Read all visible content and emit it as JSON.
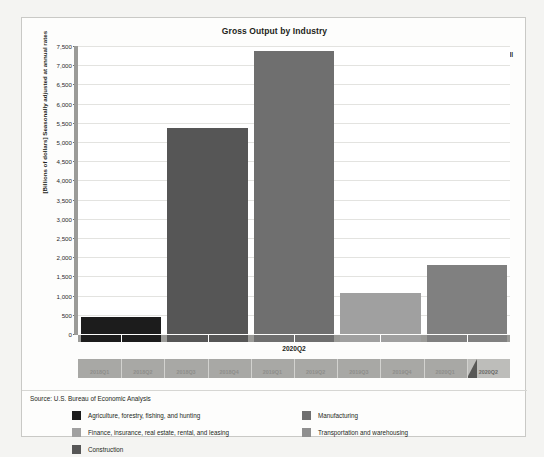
{
  "chart_data": {
    "type": "bar",
    "title": "Gross Output by Industry",
    "xlabel": "",
    "ylabel": "[Billions of dollars] Seasonally adjusted at annual rates",
    "ylim": [
      0,
      7500
    ],
    "ytick_labels": [
      "7,500",
      "7,000",
      "6,500",
      "6,000",
      "5,500",
      "5,000",
      "4,500",
      "4,000",
      "3,500",
      "3,000",
      "2,500",
      "2,000",
      "1,500",
      "1,000",
      "500",
      "0"
    ],
    "ytick_values": [
      7500,
      7000,
      6500,
      6000,
      5500,
      5000,
      4500,
      4000,
      3500,
      3000,
      2500,
      2000,
      1500,
      1000,
      500,
      0
    ],
    "grid": true,
    "legend_position": "bottom",
    "selected_period": "2020Q2",
    "categories": [
      "Agriculture, forestry, fishing, and hunting",
      "Construction",
      "Manufacturing",
      "Finance, insurance, real estate, rental, and leasing",
      "Transportation and warehousing"
    ],
    "values": [
      440,
      5370,
      7370,
      1070,
      1800
    ],
    "colors": [
      "#1c1c1c",
      "#565656",
      "#6f6f6f",
      "#a0a0a0",
      "#808080"
    ],
    "bar_value_labels": [
      "",
      "",
      "",
      "",
      ""
    ],
    "source": "Source: U.S. Bureau of Economic Analysis"
  },
  "header": {
    "title": "Gross Output by Industry",
    "show_all_label": "Show all"
  },
  "axis": {
    "y_title": "[Billions of dollars] Seasonally adjusted at annual rates",
    "period_label": "2020Q2"
  },
  "slider": {
    "labels": [
      "2018Q1",
      "2018Q2",
      "2018Q3",
      "2018Q4",
      "2019Q1",
      "2019Q2",
      "2019Q3",
      "2019Q4",
      "2020Q1",
      "2020Q2"
    ],
    "selected": "2020Q2"
  },
  "legend": {
    "column1": [
      {
        "label": "Agriculture, forestry, fishing, and hunting",
        "color": "#1c1c1c"
      },
      {
        "label": "Finance, insurance, real estate, rental, and leasing",
        "color": "#a0a0a0"
      },
      {
        "label": "Construction",
        "color": "#565656"
      }
    ],
    "column2": [
      {
        "label": "Manufacturing",
        "color": "#6f6f6f"
      },
      {
        "label": "Transportation and warehousing",
        "color": "#8f8f8f"
      }
    ]
  },
  "footer": {
    "source": "Source: U.S. Bureau of Economic Analysis"
  }
}
